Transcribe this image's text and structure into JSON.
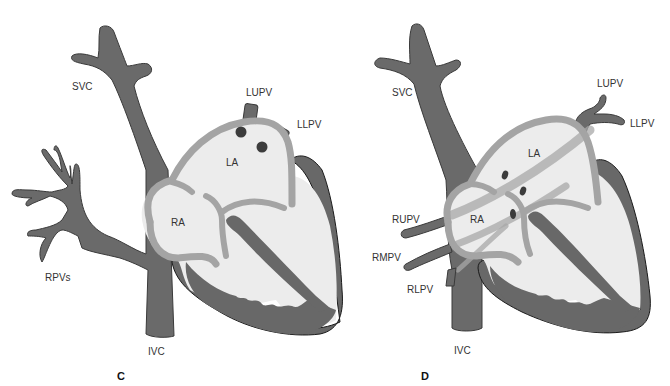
{
  "figure": {
    "colors": {
      "vessel": "#6a6a6a",
      "chamber_fill": "#ececec",
      "septum_wall": "#a4a4a4",
      "outline": "#1a1a1a",
      "background": "#ffffff"
    }
  },
  "panels": [
    {
      "id": "C",
      "panel_label": "C",
      "labels": {
        "svc": "SVC",
        "ivc": "IVC",
        "la": "LA",
        "ra": "RA",
        "lupv": "LUPV",
        "llpv": "LLPV",
        "rpvs": "RPVs"
      }
    },
    {
      "id": "D",
      "panel_label": "D",
      "labels": {
        "svc": "SVC",
        "ivc": "IVC",
        "la": "LA",
        "ra": "RA",
        "lupv": "LUPV",
        "llpv": "LLPV",
        "rupv": "RUPV",
        "rmpv": "RMPV",
        "rlpv": "RLPV"
      }
    }
  ]
}
